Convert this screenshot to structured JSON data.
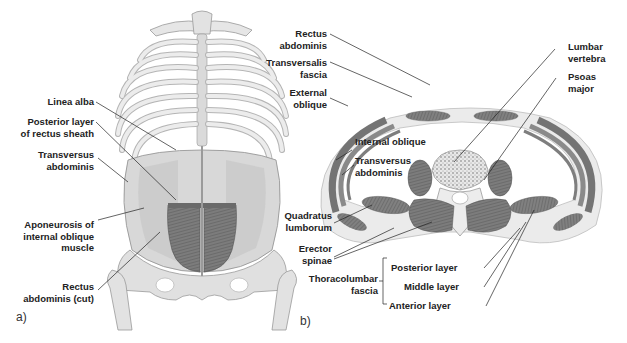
{
  "figure": {
    "panel_a": {
      "tag": "a)",
      "labels": {
        "linea_alba": "Linea alba",
        "posterior_layer": "Posterior layer\nof rectus sheath",
        "transversus": "Transversus\nabdominis",
        "aponeurosis": "Aponeurosis of\ninternal oblique\nmuscle",
        "rectus_cut": "Rectus\nabdominis (cut)"
      }
    },
    "panel_b": {
      "tag": "b)",
      "labels": {
        "rectus": "Rectus\nabdominis",
        "transversalis": "Transversalis\nfascia",
        "external_oblique": "External\noblique",
        "internal_oblique": "Internal oblique",
        "transversus": "Transversus\nabdominis",
        "quadratus": "Quadratus\nlumborum",
        "erector": "Erector\nspinae",
        "thoracolumbar": "Thoracolumbar\nfascia",
        "posterior_layer": "Posterior layer",
        "middle_layer": "Middle layer",
        "anterior_layer": "Anterior layer",
        "lumbar_vertebra": "Lumbar\nvertebra",
        "psoas": "Psoas\nmajor"
      }
    },
    "colors": {
      "bone": "#e4e4e4",
      "bone_edge": "#9a9a9a",
      "muscle": "#7a7a7a",
      "muscle_dark": "#5e5e5e",
      "fascia": "#efefef",
      "line": "#222222"
    }
  }
}
